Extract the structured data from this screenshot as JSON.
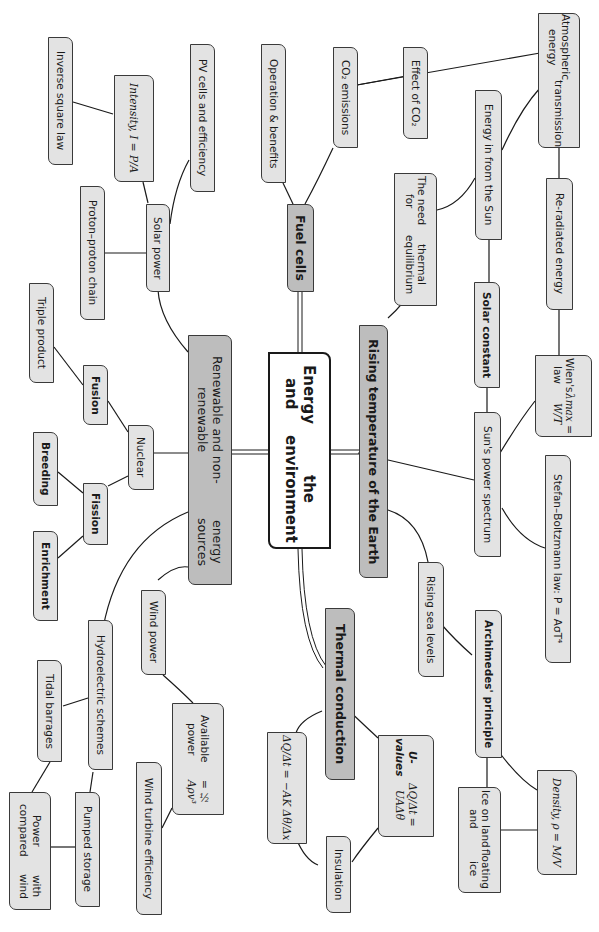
{
  "root": {
    "label_line1": "Energy and",
    "label_line2": "the environment"
  },
  "branches": {
    "renewable": {
      "label_line1": "Renewable and non-renewable",
      "label_line2": "energy sources",
      "children": {
        "solar_power": "Solar power",
        "intensity": "Intensity, I = P/A",
        "inverse_square": "Inverse square law",
        "pv_cells": "PV cells and efficiency",
        "proton_chain": "Proton–proton chain",
        "nuclear": "Nuclear",
        "fusion": "Fusion",
        "triple_product": "Triple product",
        "fission": "Fission",
        "breeding": "Breeding",
        "enrichment": "Enrichment",
        "wind_power": "Wind power",
        "available_power_line1": "Available power",
        "available_power_line2": "= ½ Aρv³",
        "wind_turbine": "Wind turbine efficiency",
        "hydroelectric": "Hydroelectric schemes",
        "tidal": "Tidal barrages",
        "pumped": "Pumped storage",
        "power_compared_line1": "Power compared",
        "power_compared_line2": "with wind"
      }
    },
    "fuel_cells": {
      "label": "Fuel cells",
      "children": {
        "operation": "Operation & benefits",
        "co2_emissions": "CO₂ emissions",
        "effect_co2": "Effect of CO₂"
      }
    },
    "rising_temp": {
      "label": "Rising temperature of the Earth",
      "children": {
        "atmospheric_line1": "Atmospheric energy",
        "atmospheric_line2": "transmission",
        "energy_sun": "Energy in from the Sun",
        "thermal_eq_line1": "The need for",
        "thermal_eq_line2": "thermal equilibrium",
        "reradiated": "Re-radiated energy",
        "solar_constant": "Solar constant",
        "wien_line1": "Wien's law",
        "wien_line2": "λmax = W/T",
        "suns_spectrum": "Sun's power spectrum",
        "stefan": "Stefan–Boltzmann law: P = AσT⁴",
        "rising_sea": "Rising sea levels",
        "archimedes": "Archimedes' principle",
        "density": "Density, ρ = M/V",
        "ice_line1": "Ice on land and",
        "ice_line2": "floating ice"
      }
    },
    "thermal": {
      "label": "Thermal conduction",
      "children": {
        "uvalues_line1": "U-values",
        "uvalues_line2": "ΔQ/Δt = UAΔθ",
        "fourier": "ΔQ/Δt = −AK Δθ/Δx",
        "insulation": "Insulation"
      }
    }
  },
  "colors": {
    "main_branch": "#bdbdbd",
    "sub_node": "#e3e3e3",
    "root": "#ffffff",
    "stroke": "#1a1a1a"
  }
}
